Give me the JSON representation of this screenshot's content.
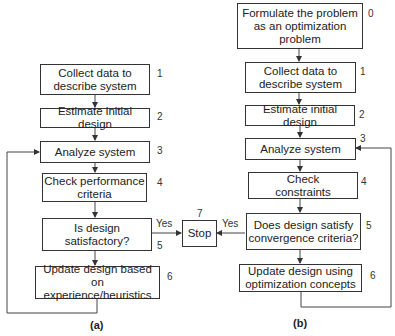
{
  "diagram_a": {
    "caption": "(a)",
    "steps": [
      {
        "num": "1",
        "text": "Collect data to\ndescribe system"
      },
      {
        "num": "2",
        "text": "Estimate initial design"
      },
      {
        "num": "3",
        "text": "Analyze system"
      },
      {
        "num": "4",
        "text": "Check performance\ncriteria"
      },
      {
        "num": "5",
        "text": "Is design\nsatisfactory?"
      },
      {
        "num": "6",
        "text": "Update design based on\nexperience/heuristics"
      }
    ],
    "yes_label": "Yes"
  },
  "stop": {
    "num": "7",
    "text": "Stop"
  },
  "diagram_b": {
    "caption": "(b)",
    "steps": [
      {
        "num": "0",
        "text": "Formulate the problem\nas an optimization\nproblem"
      },
      {
        "num": "1",
        "text": "Collect data to\ndescribe system"
      },
      {
        "num": "2",
        "text": "Estimate initial design"
      },
      {
        "num": "3",
        "text": "Analyze system"
      },
      {
        "num": "4",
        "text": "Check\nconstraints"
      },
      {
        "num": "5",
        "text": "Does design satisfy\nconvergence criteria?"
      },
      {
        "num": "6",
        "text": "Update design using\noptimization concepts"
      }
    ],
    "yes_label": "Yes"
  }
}
